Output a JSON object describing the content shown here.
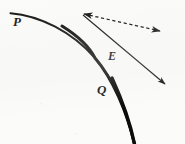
{
  "figure": {
    "caption": "",
    "background_color": "#fbfbfa",
    "ink_color": "#141414",
    "labels": [
      {
        "id": "P",
        "text": "P",
        "x": 18,
        "y": 22,
        "style": "italic-serif-bold",
        "meaning": "region-above-interface"
      },
      {
        "id": "E",
        "text": "E",
        "x": 113,
        "y": 57,
        "style": "italic-serif-bold",
        "meaning": "point-on-interface"
      },
      {
        "id": "Q",
        "text": "Q",
        "x": 102,
        "y": 90,
        "style": "italic-serif-bold",
        "meaning": "region-below-interface"
      }
    ],
    "curve": {
      "name": "interface-curve",
      "description": "thick concave boundary arc separating region P from region Q",
      "stroke_width_start": 2.0,
      "stroke_width_end": 3.2,
      "path": "M 10.5 13.2 C 40 15.5, 72 32, 95 58 C 113 79, 127 112, 134.5 144"
    },
    "dashed_arrow": {
      "name": "dashed-double-arrow",
      "from_x": 84,
      "from_y": 14,
      "to_x": 160,
      "to_y": 31,
      "dash_pattern": "3.2 2.6",
      "stroke_width": 1.2,
      "arrowhead_start": true,
      "arrowhead_end": true
    },
    "solid_arrow": {
      "name": "solid-ray-arrow",
      "from_x": 83,
      "from_y": 15,
      "to_x": 165,
      "to_y": 84,
      "stroke_width": 1.1,
      "arrowhead_start": false,
      "arrowhead_end": true
    }
  }
}
